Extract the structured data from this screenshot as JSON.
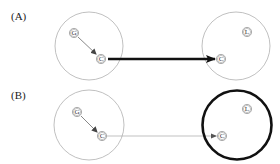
{
  "colors": {
    "thin_circle": "#b0b0b0",
    "thick_circle": "#111111",
    "thick_arrow": "#111111",
    "thin_arrow": "#a8a8a8",
    "inner_arrow": "#555555",
    "text": "#222222"
  },
  "panels": [
    {
      "label": "(A)",
      "left_circle": {
        "nodes": [
          {
            "letter": "G"
          },
          {
            "letter": "C"
          }
        ],
        "inner_arrow": "G→C"
      },
      "right_circle": {
        "style": "thin",
        "nodes": [
          {
            "letter": "L"
          },
          {
            "letter": "C"
          }
        ]
      },
      "connector": {
        "style": "thick",
        "from": "C",
        "to": "C"
      }
    },
    {
      "label": "(B)",
      "left_circle": {
        "nodes": [
          {
            "letter": "G"
          },
          {
            "letter": "C"
          }
        ],
        "inner_arrow": "G→C"
      },
      "right_circle": {
        "style": "thick",
        "nodes": [
          {
            "letter": "L"
          },
          {
            "letter": "C"
          }
        ]
      },
      "connector": {
        "style": "thin",
        "from": "C",
        "to": "C"
      }
    }
  ]
}
